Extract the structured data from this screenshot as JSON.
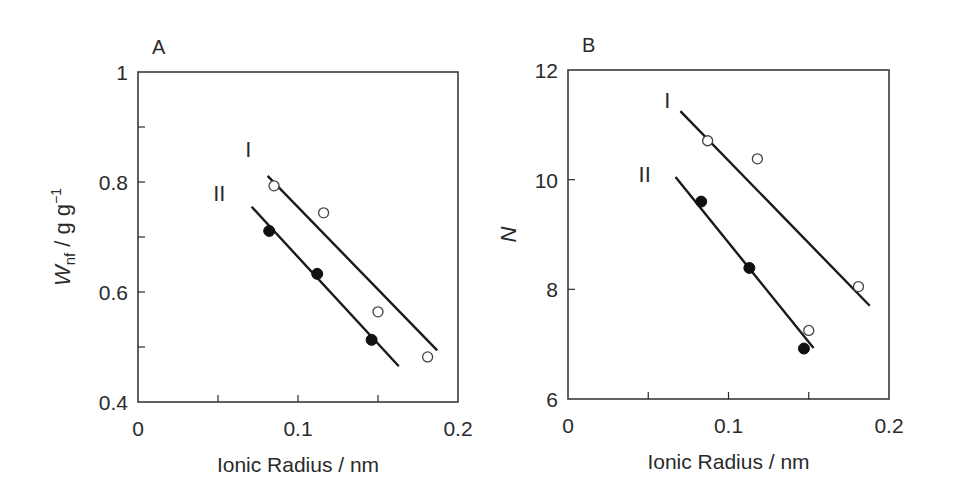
{
  "chart_data": [
    {
      "type": "scatter",
      "panel_label": "A",
      "title": "",
      "xlabel": "Ionic Radius / nm",
      "ylabel": {
        "main": "W",
        "sub": "nf",
        "unit": " / g g",
        "sup": "-1"
      },
      "xlim": [
        0,
        0.2
      ],
      "ylim": [
        0.4,
        1.0
      ],
      "xticks": [
        0,
        0.05,
        0.1,
        0.15,
        0.2
      ],
      "xtick_labels": [
        "0",
        "",
        "0.1",
        "",
        "0.2"
      ],
      "yticks": [
        0.4,
        0.5,
        0.6,
        0.7,
        0.8,
        0.9,
        1.0
      ],
      "ytick_labels": [
        "0.4",
        "",
        "0.6",
        "",
        "0.8",
        "",
        "1"
      ],
      "grid": false,
      "legend": "none",
      "series": [
        {
          "name": "I",
          "marker": "open-circle",
          "x": [
            0.085,
            0.116,
            0.15,
            0.181
          ],
          "y": [
            0.793,
            0.744,
            0.564,
            0.482
          ],
          "fit_line": {
            "x": [
              0.081,
              0.187
            ],
            "y": [
              0.811,
              0.494
            ]
          },
          "label_pos": {
            "x": 0.067,
            "y": 0.845
          }
        },
        {
          "name": "II",
          "marker": "filled-circle",
          "x": [
            0.082,
            0.112,
            0.146
          ],
          "y": [
            0.711,
            0.633,
            0.513
          ],
          "fit_line": {
            "x": [
              0.071,
              0.163
            ],
            "y": [
              0.755,
              0.465
            ]
          },
          "label_pos": {
            "x": 0.047,
            "y": 0.765
          }
        }
      ],
      "layout": {
        "left": 138,
        "top": 72,
        "right": 458,
        "bottom": 402
      }
    },
    {
      "type": "scatter",
      "panel_label": "B",
      "title": "",
      "xlabel": "Ionic Radius / nm",
      "ylabel": {
        "main": "N",
        "sub": "",
        "unit": "",
        "sup": ""
      },
      "xlim": [
        0,
        0.2
      ],
      "ylim": [
        6,
        12
      ],
      "xticks": [
        0,
        0.05,
        0.1,
        0.15,
        0.2
      ],
      "xtick_labels": [
        "0",
        "",
        "0.1",
        "",
        "0.2"
      ],
      "yticks": [
        6,
        8,
        10,
        12
      ],
      "ytick_labels": [
        "6",
        "8",
        "10",
        "12"
      ],
      "grid": false,
      "legend": "none",
      "series": [
        {
          "name": "I",
          "marker": "open-circle",
          "x": [
            0.087,
            0.118,
            0.15,
            0.181
          ],
          "y": [
            10.71,
            10.38,
            7.25,
            8.05
          ],
          "fit_line": {
            "x": [
              0.07,
              0.188
            ],
            "y": [
              11.25,
              7.7
            ]
          },
          "label_pos": {
            "x": 0.06,
            "y": 11.3
          }
        },
        {
          "name": "II",
          "marker": "filled-circle",
          "x": [
            0.083,
            0.113,
            0.147
          ],
          "y": [
            9.6,
            8.39,
            6.92
          ],
          "fit_line": {
            "x": [
              0.067,
              0.153
            ],
            "y": [
              10.05,
              6.93
            ]
          },
          "label_pos": {
            "x": 0.044,
            "y": 9.95
          }
        }
      ],
      "layout": {
        "left": 568,
        "top": 70,
        "right": 889,
        "bottom": 399
      }
    }
  ]
}
